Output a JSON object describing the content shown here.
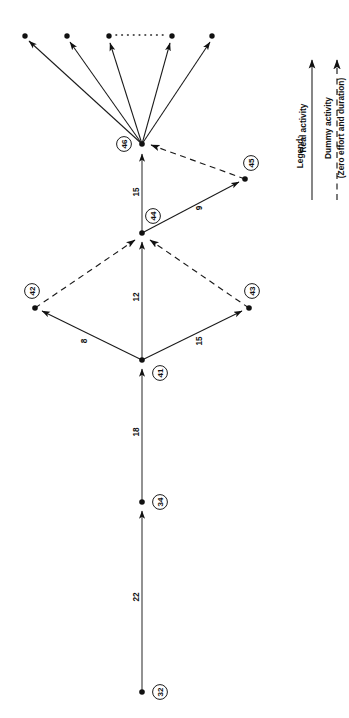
{
  "diagram": {
    "type": "activity-on-arrow-network",
    "title": "",
    "orientation": "rotated-90-ccw",
    "nodes": [
      {
        "id": "32",
        "label": "32",
        "x": 142,
        "y": 692,
        "label_cx": 160,
        "label_cy": 692
      },
      {
        "id": "34",
        "label": "34",
        "x": 142,
        "y": 502,
        "label_cx": 160,
        "label_cy": 502
      },
      {
        "id": "41",
        "label": "41",
        "x": 142,
        "y": 360,
        "label_cx": 160,
        "label_cy": 373
      },
      {
        "id": "42",
        "label": "42",
        "x": 35,
        "y": 308,
        "label_cx": 32,
        "label_cy": 291
      },
      {
        "id": "43",
        "label": "43",
        "x": 249,
        "y": 308,
        "label_cx": 252,
        "label_cy": 291
      },
      {
        "id": "44",
        "label": "44",
        "x": 142,
        "y": 233,
        "label_cx": 153,
        "label_cy": 216
      },
      {
        "id": "45",
        "label": "45",
        "x": 245,
        "y": 179,
        "label_cx": 251,
        "label_cy": 163
      },
      {
        "id": "46",
        "label": "46",
        "x": 142,
        "y": 144,
        "label_cx": 124,
        "label_cy": 144
      }
    ],
    "edges": [
      {
        "from": "32",
        "to": "34",
        "duration": "22",
        "kind": "real",
        "label_x": 136,
        "label_y": 597
      },
      {
        "from": "34",
        "to": "41",
        "duration": "18",
        "kind": "real",
        "label_x": 136,
        "label_y": 432
      },
      {
        "from": "41",
        "to": "42",
        "duration": "8",
        "kind": "real",
        "label_x": 84,
        "label_y": 341
      },
      {
        "from": "41",
        "to": "43",
        "duration": "15",
        "kind": "real",
        "label_x": 199,
        "label_y": 341
      },
      {
        "from": "41",
        "to": "44",
        "duration": "12",
        "kind": "real",
        "label_x": 136,
        "label_y": 297
      },
      {
        "from": "42",
        "to": "44",
        "duration": "",
        "kind": "dummy",
        "label_x": 0,
        "label_y": 0
      },
      {
        "from": "43",
        "to": "44",
        "duration": "",
        "kind": "dummy",
        "label_x": 0,
        "label_y": 0
      },
      {
        "from": "44",
        "to": "45",
        "duration": "9",
        "kind": "real",
        "label_x": 199,
        "label_y": 208
      },
      {
        "from": "44",
        "to": "46",
        "duration": "15",
        "kind": "real",
        "label_x": 136,
        "label_y": 192
      },
      {
        "from": "45",
        "to": "46",
        "duration": "",
        "kind": "dummy",
        "label_x": 0,
        "label_y": 0
      }
    ],
    "fan_targets": [
      {
        "x": 25,
        "y": 36
      },
      {
        "x": 67,
        "y": 36
      },
      {
        "x": 109,
        "y": 36
      },
      {
        "x": 172,
        "y": 36
      },
      {
        "x": 212,
        "y": 36
      }
    ],
    "ellipsis": {
      "x1": 115,
      "y1": 35,
      "x2": 166,
      "y2": 35
    }
  },
  "legend": {
    "title": "Legend:",
    "title_x": 300,
    "title_y": 152,
    "items": [
      {
        "label": "Real activity",
        "kind": "real",
        "line_x": 312,
        "line_y1": 200,
        "line_y2": 52,
        "text_x": 302,
        "text_y": 125
      },
      {
        "label": "Dummy activity",
        "sublabel": "(Zero effort and duration)",
        "kind": "dummy",
        "line_x": 337,
        "line_y1": 200,
        "line_y2": 52,
        "text_x": 327,
        "text_y": 125,
        "subtext_x": 340,
        "subtext_y": 125
      }
    ]
  },
  "colors": {
    "ink": "#111111",
    "line": "#1a1a1a",
    "background": "#ffffff"
  }
}
